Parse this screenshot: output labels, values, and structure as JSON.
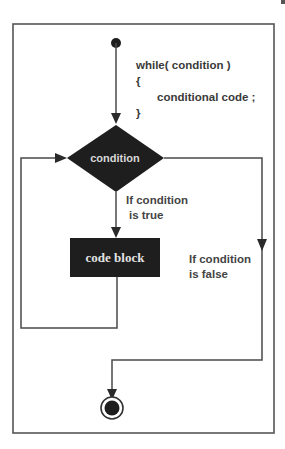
{
  "diagram": {
    "type": "flowchart",
    "code_snippet": {
      "line1": "while( condition )",
      "line2": "{",
      "line3": "conditional code ;",
      "line4": "}"
    },
    "nodes": {
      "start": {
        "shape": "filled-circle",
        "label": ""
      },
      "condition": {
        "shape": "diamond",
        "label": "condition"
      },
      "code_block": {
        "shape": "rectangle",
        "label": "code block"
      },
      "end": {
        "shape": "bullseye-circle",
        "label": ""
      }
    },
    "edges": [
      {
        "from": "start",
        "to": "condition",
        "label": ""
      },
      {
        "from": "condition",
        "to": "code_block",
        "label": "If condition is true"
      },
      {
        "from": "code_block",
        "to": "condition",
        "label": ""
      },
      {
        "from": "condition",
        "to": "end",
        "label": "If condition is false"
      }
    ],
    "labels": {
      "true_line1": "If condition",
      "true_line2": "is true",
      "false_line1": "If condition",
      "false_line2": "is false"
    },
    "colors": {
      "node_fill": "#1e1e1e",
      "line": "#4a4a4a",
      "frame": "#555555",
      "background": "#ffffff"
    }
  }
}
